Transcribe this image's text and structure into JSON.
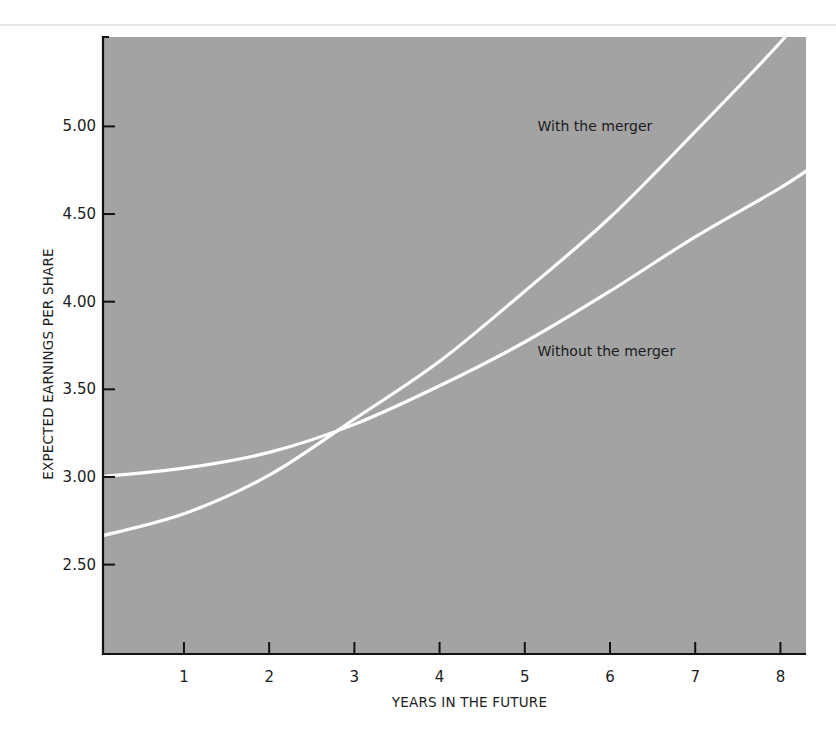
{
  "chart_data": {
    "type": "line",
    "title": "",
    "xlabel": "YEARS IN THE FUTURE",
    "ylabel": "EXPECTED EARNINGS PER SHARE",
    "xlim": [
      0.05,
      8.3
    ],
    "ylim": [
      1.99,
      5.51
    ],
    "x_ticks": [
      1,
      2,
      3,
      4,
      5,
      6,
      7,
      8
    ],
    "x_tick_labels": [
      "1",
      "2",
      "3",
      "4",
      "5",
      "6",
      "7",
      "8"
    ],
    "y_ticks": [
      2.5,
      3.0,
      3.5,
      4.0,
      4.5,
      5.0
    ],
    "y_tick_labels": [
      "2.50",
      "3.00",
      "3.50",
      "4.00",
      "4.50",
      "5.00"
    ],
    "grid": false,
    "legend": "none (inline annotations)",
    "background_color": "#a3a3a3",
    "line_color": "#ffffff",
    "x": [
      0,
      1,
      2,
      3,
      4,
      5,
      6,
      7,
      8
    ],
    "series": [
      {
        "name": "With the merger",
        "values": [
          2.66,
          2.79,
          3.01,
          3.33,
          3.66,
          4.06,
          4.48,
          4.97,
          5.48
        ]
      },
      {
        "name": "Without the merger",
        "values": [
          3.0,
          3.05,
          3.14,
          3.3,
          3.52,
          3.77,
          4.06,
          4.37,
          4.65
        ]
      }
    ],
    "annotations": [
      {
        "text": "With the merger",
        "x": 5.15,
        "y": 5.0
      },
      {
        "text": "Without the merger",
        "x": 5.15,
        "y": 3.72
      }
    ],
    "crossing_point": {
      "x": 2.9,
      "y": 3.3
    }
  }
}
